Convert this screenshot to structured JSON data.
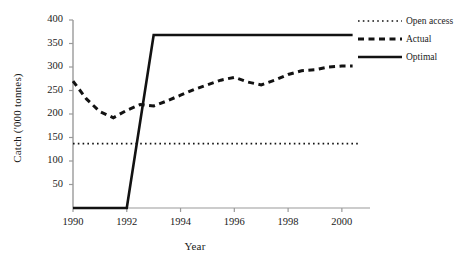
{
  "chart_data": {
    "type": "line",
    "title": "",
    "xlabel": "Year",
    "ylabel": "Catch ('000  tonnes)",
    "xlim": [
      1990,
      2000.6
    ],
    "ylim": [
      0,
      400
    ],
    "xticks": [
      "1990",
      "1992",
      "1994",
      "1996",
      "1998",
      "2000"
    ],
    "xtick_values": [
      1990,
      1992,
      1994,
      1996,
      1998,
      2000
    ],
    "yticks": [
      "50",
      "100",
      "150",
      "200",
      "250",
      "300",
      "350",
      "400"
    ],
    "ytick_values": [
      50,
      100,
      150,
      200,
      250,
      300,
      350,
      400
    ],
    "grid": false,
    "legend_position": "top-right",
    "series": [
      {
        "name": "Open access",
        "style": "dotted",
        "x": [
          1990,
          2000.6
        ],
        "values": [
          137,
          137
        ]
      },
      {
        "name": "Actual",
        "style": "dashed",
        "x": [
          1990,
          1990.5,
          1991,
          1991.5,
          1992,
          1992.5,
          1993,
          1993.5,
          1994,
          1994.5,
          1995,
          1995.5,
          1996,
          1996.5,
          1997,
          1997.5,
          1998,
          1998.5,
          1999,
          1999.5,
          2000,
          2000.4
        ],
        "values": [
          270,
          232,
          205,
          192,
          208,
          220,
          217,
          228,
          240,
          252,
          262,
          272,
          278,
          268,
          262,
          272,
          284,
          292,
          294,
          300,
          302,
          302
        ]
      },
      {
        "name": "Optimal",
        "style": "solid",
        "x": [
          1990,
          1992,
          1993,
          2000.4
        ],
        "values": [
          0,
          0,
          368,
          368
        ]
      }
    ]
  },
  "legend": {
    "items": [
      {
        "label": "Open access",
        "style": "dotted"
      },
      {
        "label": "Actual",
        "style": "dashed"
      },
      {
        "label": "Optimal",
        "style": "solid"
      }
    ]
  }
}
